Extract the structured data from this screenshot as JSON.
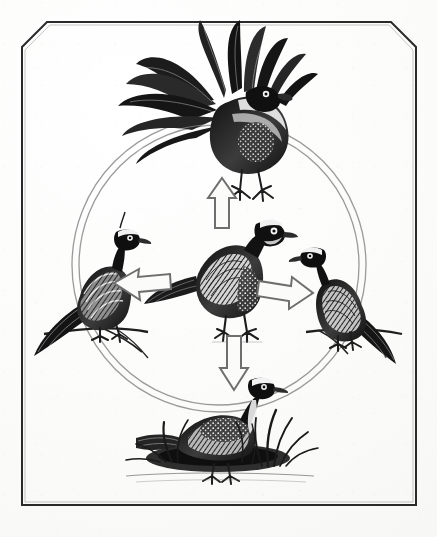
{
  "figure": {
    "medium": "pen-and-ink line illustration",
    "caption": "",
    "background_color": "#fdfdfc",
    "ink_color": "#1a1a1a",
    "ring_color": "#8c8c8c",
    "arrow_outline_color": "#6e6e6e",
    "arrow_fill_color": "#fbfbfa"
  },
  "frame": {
    "name": "chamfered-panel-border",
    "stroke_color": "#2a2a2a",
    "stroke_width": 2,
    "corners": {
      "top_left": "chamfered",
      "top_right": "chamfered",
      "bottom_left": "square",
      "bottom_right": "square"
    }
  },
  "ring": {
    "name": "double-ring",
    "center": {
      "x": 219,
      "y": 265
    },
    "radius_outer": 147,
    "radius_inner": 140,
    "stroke_color": "#9a9a9a",
    "stroke_width": 1.2
  },
  "center_subject": {
    "label": "standing-pigeon",
    "description": "Adult pigeon standing, facing right, neutral posture",
    "position": {
      "x": 219,
      "y": 270
    }
  },
  "nodes": [
    {
      "id": "top",
      "label": "displaying-male",
      "description": "Male in full courtship display with fanned tail raised",
      "position": {
        "x": 222,
        "y": 105
      },
      "arrow": {
        "id": "arrow-up",
        "direction": "up",
        "from": "center",
        "to": "displaying-male"
      }
    },
    {
      "id": "left",
      "label": "perched-bird-left",
      "description": "Bird perched on branch, facing right",
      "position": {
        "x": 90,
        "y": 292
      },
      "arrow": {
        "id": "arrow-left",
        "direction": "left",
        "from": "center",
        "to": "perched-bird-left"
      }
    },
    {
      "id": "right",
      "label": "perched-bird-right",
      "description": "Bird perched on branch, facing left",
      "position": {
        "x": 352,
        "y": 305
      },
      "arrow": {
        "id": "arrow-right",
        "direction": "right",
        "from": "center",
        "to": "perched-bird-right"
      }
    },
    {
      "id": "bottom",
      "label": "nesting-bird",
      "description": "Bird brooding on a ground nest among grass tussocks",
      "position": {
        "x": 222,
        "y": 430
      },
      "arrow": {
        "id": "arrow-down",
        "direction": "down",
        "from": "center",
        "to": "nesting-bird"
      }
    }
  ],
  "arrows": [
    {
      "name": "arrow-up",
      "direction": "up",
      "x": 222,
      "y": 200
    },
    {
      "name": "arrow-right",
      "direction": "right",
      "x": 285,
      "y": 288
    },
    {
      "name": "arrow-left",
      "direction": "left",
      "x": 140,
      "y": 282
    },
    {
      "name": "arrow-down",
      "direction": "down",
      "x": 234,
      "y": 358
    }
  ]
}
